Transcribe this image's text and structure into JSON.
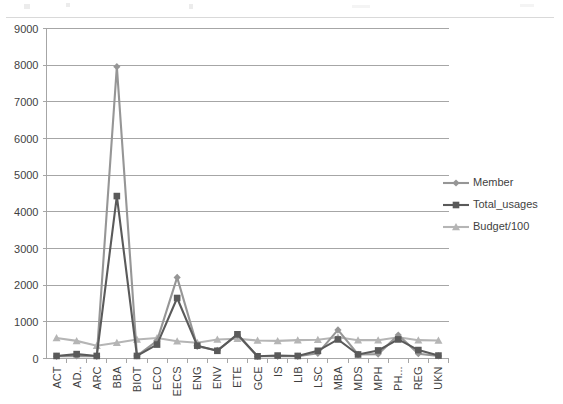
{
  "chart_data": {
    "type": "line",
    "title": "",
    "subtitle": "",
    "xlabel": "",
    "ylabel": "",
    "ylim": [
      0,
      9000
    ],
    "y_ticks": [
      0,
      1000,
      2000,
      3000,
      4000,
      5000,
      6000,
      7000,
      8000,
      9000
    ],
    "grid": true,
    "legend_position": "right",
    "categories": [
      "ACT",
      "AD..",
      "ARC",
      "BBA",
      "BIOT",
      "ECO",
      "EECS",
      "ENG",
      "ENV",
      "ETE",
      "GCE",
      "IS",
      "LIB",
      "LSC",
      "MBA",
      "MDS",
      "MPH",
      "PH...",
      "REG",
      "UKN"
    ],
    "series": [
      {
        "name": "Member",
        "marker": "diamond",
        "color": "#969696",
        "values": [
          60,
          70,
          60,
          7960,
          70,
          480,
          2210,
          330,
          220,
          640,
          60,
          60,
          60,
          140,
          780,
          110,
          120,
          640,
          130,
          70
        ]
      },
      {
        "name": "Total_usages",
        "marker": "square",
        "color": "#5a5a5a",
        "values": [
          70,
          120,
          70,
          4430,
          70,
          380,
          1650,
          350,
          210,
          660,
          60,
          80,
          70,
          210,
          520,
          110,
          220,
          520,
          230,
          80
        ]
      },
      {
        "name": "Budget/100",
        "marker": "triangle",
        "color": "#b5b5b5",
        "values": [
          560,
          480,
          350,
          430,
          520,
          560,
          470,
          430,
          520,
          540,
          490,
          480,
          500,
          510,
          580,
          500,
          500,
          580,
          500,
          490
        ]
      }
    ]
  },
  "legend": {
    "entries": [
      {
        "label": "Member"
      },
      {
        "label": "Total_usages"
      },
      {
        "label": "Budget/100"
      }
    ]
  },
  "axis": {
    "y_labels": [
      "9000",
      "8000",
      "7000",
      "6000",
      "5000",
      "4000",
      "3000",
      "2000",
      "1000",
      "0"
    ],
    "x_labels": [
      "ACT",
      "AD..",
      "ARC",
      "BBA",
      "BIOT",
      "ECO",
      "EECS",
      "ENG",
      "ENV",
      "ETE",
      "GCE",
      "IS",
      "LIB",
      "LSC",
      "MBA",
      "MDS",
      "MPH",
      "PH...",
      "REG",
      "UKN"
    ]
  },
  "colors": {
    "member": "#969696",
    "total_usages": "#5a5a5a",
    "budget": "#b5b5b5",
    "grid": "#a6a6a6",
    "text": "#3f3f3f",
    "background": "#ffffff"
  }
}
